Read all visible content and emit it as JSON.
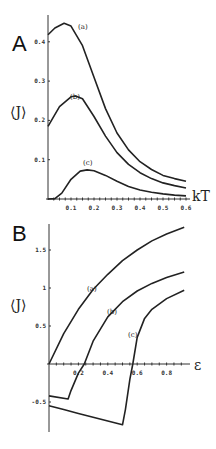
{
  "chart_data": [
    {
      "panel": "A",
      "type": "line",
      "title": "",
      "xlabel": "kT",
      "ylabel": "⟨J⟩",
      "xlim": [
        0,
        0.6
      ],
      "ylim": [
        0,
        0.45
      ],
      "x_ticks": [
        "0.1",
        "0.2",
        "0.3",
        "0.4",
        "0.5",
        "0.6"
      ],
      "y_ticks": [
        "0.1",
        "0.2",
        "0.3",
        "0.4"
      ],
      "grid": false,
      "series": [
        {
          "name": "(a)",
          "x": [
            0,
            0.03,
            0.07,
            0.1,
            0.15,
            0.2,
            0.25,
            0.3,
            0.35,
            0.4,
            0.45,
            0.5,
            0.55,
            0.6
          ],
          "values": [
            0.418,
            0.435,
            0.447,
            0.44,
            0.39,
            0.31,
            0.23,
            0.168,
            0.125,
            0.095,
            0.075,
            0.06,
            0.052,
            0.045
          ]
        },
        {
          "name": "(b)",
          "x": [
            0,
            0.05,
            0.1,
            0.12,
            0.15,
            0.2,
            0.25,
            0.3,
            0.35,
            0.4,
            0.45,
            0.5,
            0.55,
            0.6
          ],
          "values": [
            0.185,
            0.235,
            0.26,
            0.262,
            0.255,
            0.21,
            0.16,
            0.118,
            0.088,
            0.067,
            0.052,
            0.041,
            0.034,
            0.028
          ]
        },
        {
          "name": "(c)",
          "x": [
            0,
            0.03,
            0.06,
            0.1,
            0.14,
            0.17,
            0.2,
            0.25,
            0.3,
            0.35,
            0.4,
            0.45,
            0.5,
            0.55,
            0.6
          ],
          "values": [
            0,
            0.001,
            0.015,
            0.05,
            0.071,
            0.074,
            0.072,
            0.06,
            0.045,
            0.032,
            0.023,
            0.017,
            0.013,
            0.01,
            0.008
          ]
        }
      ],
      "annotations": [
        "(a)",
        "(b)",
        "(c)"
      ]
    },
    {
      "panel": "B",
      "type": "line",
      "title": "",
      "xlabel": "ε",
      "ylabel": "⟨J⟩",
      "xlim": [
        0,
        0.92
      ],
      "ylim": [
        -0.85,
        1.8
      ],
      "x_ticks": [
        "0.2",
        "0.4",
        "0.6",
        "0.8"
      ],
      "y_ticks": [
        "-0.5",
        "0.5",
        "1",
        "1.5"
      ],
      "grid": false,
      "series": [
        {
          "name": "(a)",
          "x": [
            0,
            0.1,
            0.2,
            0.3,
            0.4,
            0.5,
            0.6,
            0.7,
            0.8,
            0.92
          ],
          "values": [
            0,
            0.4,
            0.72,
            0.98,
            1.18,
            1.36,
            1.5,
            1.62,
            1.71,
            1.8
          ]
        },
        {
          "name": "(b)",
          "x": [
            0,
            0.13,
            0.15,
            0.2,
            0.24,
            0.3,
            0.4,
            0.5,
            0.6,
            0.7,
            0.8,
            0.92
          ],
          "values": [
            -0.42,
            -0.46,
            -0.35,
            -0.12,
            0,
            0.3,
            0.62,
            0.82,
            0.96,
            1.06,
            1.14,
            1.21
          ]
        },
        {
          "name": "(c)",
          "x": [
            0,
            0.1,
            0.2,
            0.3,
            0.4,
            0.5,
            0.52,
            0.55,
            0.57,
            0.6,
            0.65,
            0.7,
            0.8,
            0.92
          ],
          "values": [
            -0.55,
            -0.6,
            -0.65,
            -0.7,
            -0.75,
            -0.8,
            -0.6,
            -0.2,
            0,
            0.35,
            0.6,
            0.72,
            0.86,
            0.97
          ]
        }
      ],
      "annotations": [
        "(a)",
        "(b)",
        "(c)"
      ]
    }
  ],
  "labels": {
    "panel_a": "A",
    "panel_b": "B",
    "a_xlabel": "kT",
    "a_ylabel": "⟨J⟩",
    "b_xlabel": "ε",
    "b_ylabel": "⟨J⟩",
    "curve_a": "(a)",
    "curve_b": "(b)",
    "curve_c": "(c)"
  }
}
